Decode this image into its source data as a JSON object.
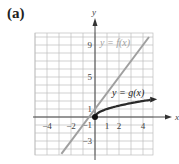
{
  "figure": {
    "panel_label": "(a)",
    "x_axis_name": "x",
    "y_axis_name": "y",
    "f_label": "y = f(x)",
    "g_label": "y = g(x)",
    "colors": {
      "grid": "#bdbdbd",
      "axes": "#333333",
      "f_line": "#a0a0a0",
      "g_curve": "#2a2a2a",
      "tick_text": "#444444"
    }
  },
  "chart_data": {
    "type": "line",
    "title": "(a)",
    "xlabel": "x",
    "ylabel": "y",
    "xlim": [
      -5,
      5
    ],
    "ylim": [
      -5,
      10.5
    ],
    "grid": true,
    "x_tick_labels": [
      "-4",
      "-2",
      "1",
      "2",
      "4"
    ],
    "y_tick_labels": [
      "9",
      "5",
      "1",
      "-1",
      "-3"
    ],
    "series": [
      {
        "name": "y = f(x)",
        "formula": "2x + 1",
        "x": [
          -2.8,
          0,
          4.5
        ],
        "y": [
          -4.6,
          1,
          10
        ]
      },
      {
        "name": "y = g(x)",
        "formula": "sqrt(x)",
        "x": [
          0,
          0.25,
          1,
          2,
          3,
          4,
          4.8
        ],
        "y": [
          0,
          0.5,
          1,
          1.41,
          1.73,
          2,
          2.19
        ],
        "start_point": [
          0,
          0
        ]
      }
    ]
  }
}
